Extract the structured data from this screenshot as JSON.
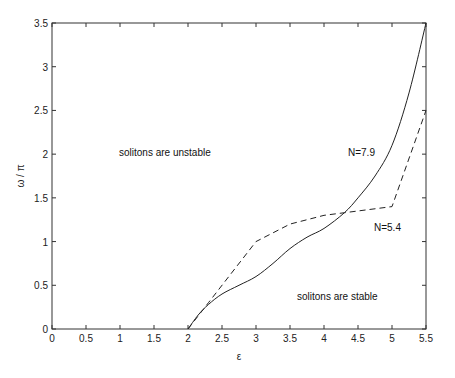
{
  "chart_data": {
    "type": "line",
    "title": "",
    "xlabel": "ε",
    "ylabel": "ω / π",
    "xlim": [
      0,
      5.5
    ],
    "ylim": [
      0,
      3.5
    ],
    "grid": false,
    "xticks": [
      "0",
      "0.5",
      "1",
      "1.5",
      "2",
      "2.5",
      "3",
      "3.5",
      "4",
      "4.5",
      "5",
      "5.5"
    ],
    "yticks": [
      "0",
      "0.5",
      "1",
      "1.5",
      "2",
      "2.5",
      "3",
      "3.5"
    ],
    "series": [
      {
        "name": "N=7.9",
        "style": "solid",
        "x": [
          2.0,
          2.15,
          2.3,
          2.5,
          2.75,
          3.0,
          3.25,
          3.5,
          3.75,
          4.0,
          4.3,
          4.5,
          4.75,
          5.0,
          5.25,
          5.5
        ],
        "y": [
          0.0,
          0.16,
          0.28,
          0.4,
          0.5,
          0.6,
          0.75,
          0.92,
          1.05,
          1.15,
          1.33,
          1.5,
          1.75,
          2.1,
          2.7,
          3.5
        ]
      },
      {
        "name": "N=5.4",
        "style": "dashed",
        "x": [
          2.0,
          2.3,
          2.6,
          3.0,
          3.25,
          3.5,
          4.0,
          4.3,
          4.5,
          5.0,
          5.5
        ],
        "y": [
          0.0,
          0.3,
          0.6,
          1.0,
          1.1,
          1.2,
          1.3,
          1.33,
          1.35,
          1.4,
          2.5
        ]
      }
    ],
    "annotations": [
      {
        "text": "solitons are unstable",
        "x": 1.85,
        "y": 2.05
      },
      {
        "text": "solitons are stable",
        "x": 3.95,
        "y": 0.3
      },
      {
        "text": "N=7.9",
        "x": 4.65,
        "y": 2.45
      },
      {
        "text": "N=5.4",
        "x": 5.0,
        "y": 1.1
      }
    ]
  },
  "labels": {
    "xlabel": "ε",
    "ylabel": "ω / π",
    "unstable": "solitons are unstable",
    "stable": "solitons are stable",
    "n79": "N=7.9",
    "n54": "N=5.4"
  }
}
